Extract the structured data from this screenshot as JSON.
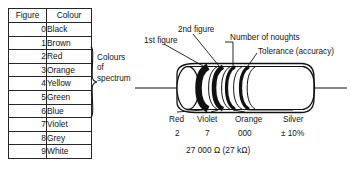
{
  "table": {
    "headers": [
      "Figure",
      "Colour"
    ],
    "rows": [
      {
        "figure": "0",
        "colour": "Black"
      },
      {
        "figure": "1",
        "colour": "Brown"
      },
      {
        "figure": "2",
        "colour": "Red"
      },
      {
        "figure": "3",
        "colour": "Orange"
      },
      {
        "figure": "4",
        "colour": "Yellow"
      },
      {
        "figure": "5",
        "colour": "Green"
      },
      {
        "figure": "6",
        "colour": "Blue"
      },
      {
        "figure": "7",
        "colour": "Violet"
      },
      {
        "figure": "8",
        "colour": "Grey"
      },
      {
        "figure": "9",
        "colour": "White"
      }
    ],
    "group_label": "Colours\nof\nspectrum"
  },
  "diagram": {
    "callouts": {
      "first_figure": "1st figure",
      "second_figure": "2nd figure",
      "noughts": "Number of noughts",
      "tolerance": "Tolerance (accuracy)"
    },
    "bands": [
      {
        "name": "Red",
        "value": "2"
      },
      {
        "name": "Violet",
        "value": "7"
      },
      {
        "name": "Orange",
        "value": "000"
      },
      {
        "name": "Silver",
        "value": "± 10%"
      }
    ],
    "total": "27 000 Ω   (27 kΩ)"
  },
  "colors": {
    "ink": "#141414",
    "paper": "#ffffff"
  }
}
